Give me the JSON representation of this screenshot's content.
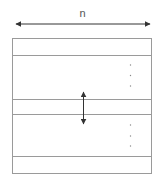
{
  "diagram": {
    "width_label": "n",
    "colors": {
      "stroke": "#9a9a9a",
      "arrow": "#333333",
      "dots": "#888888",
      "background": "#ffffff"
    },
    "box": {
      "x": 12,
      "y": 38,
      "width": 140,
      "height": 136
    },
    "horizontal_lines_y": [
      55,
      99,
      114,
      156
    ],
    "width_arrow": {
      "y": 24,
      "x1": 13,
      "x2": 153
    },
    "vertical_arrow": {
      "x": 83,
      "y1": 89,
      "y2": 127
    },
    "ellipsis_groups": [
      {
        "x": 130,
        "dots_y": [
          65,
          75,
          86
        ]
      },
      {
        "x": 130,
        "dots_y": [
          125,
          136,
          146
        ]
      }
    ]
  }
}
